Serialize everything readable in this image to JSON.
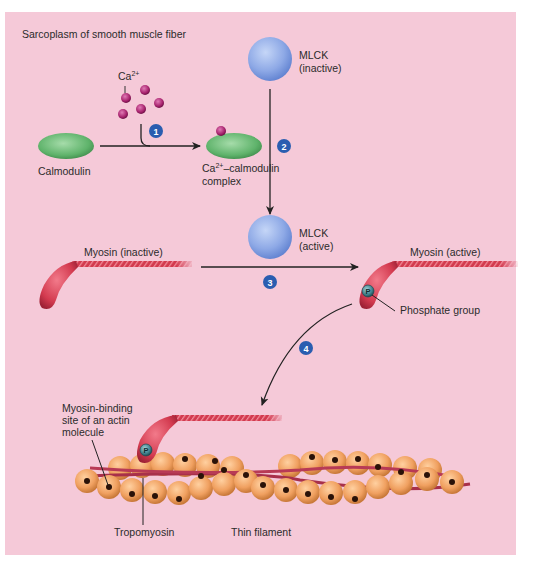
{
  "title": "Sarcoplasm of smooth muscle fiber",
  "colors": {
    "background": "#f5c9d8",
    "calmodulin": "#6fbf7a",
    "calcium": "#a8236e",
    "mlck": "#8ea9e6",
    "myosin": "#d33a4f",
    "actin": "#f0a060",
    "step_badge": "#2a5db0",
    "arrow": "#222222"
  },
  "labels": {
    "calcium": "Ca",
    "calcium_sup": "2+",
    "calmodulin": "Calmodulin",
    "complex_line1_pre": "Ca",
    "complex_line1_sup": "2+",
    "complex_line1_post": "–calmodulin",
    "complex_line2": "complex",
    "mlck_inactive_line1": "MLCK",
    "mlck_inactive_line2": "(inactive)",
    "mlck_active_line1": "MLCK",
    "mlck_active_line2": "(active)",
    "myosin_inactive": "Myosin (inactive)",
    "myosin_active": "Myosin (active)",
    "phosphate_group": "Phosphate group",
    "phosphate_symbol": "P",
    "binding_site_line1": "Myosin-binding",
    "binding_site_line2": "site of an actin",
    "binding_site_line3": "molecule",
    "tropomyosin": "Tropomyosin",
    "thin_filament": "Thin filament"
  },
  "steps": [
    "1",
    "2",
    "3",
    "4"
  ]
}
